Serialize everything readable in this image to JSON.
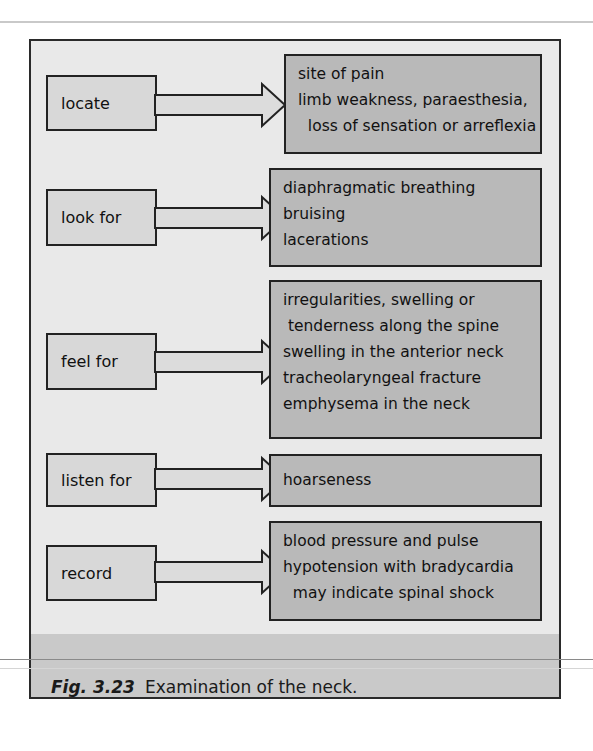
{
  "figure": {
    "caption_label": "Fig. 3.23",
    "caption_text": "Examination of the neck."
  },
  "rows": [
    {
      "action": "locate",
      "items": [
        "site of pain",
        "limb weakness, paraesthesia,",
        "  loss of sensation or arreflexia"
      ]
    },
    {
      "action": "look for",
      "items": [
        "diaphragmatic breathing",
        "bruising",
        "lacerations"
      ]
    },
    {
      "action": "feel for",
      "items": [
        "irregularities, swelling or",
        " tenderness along the spine",
        "swelling in the anterior neck",
        "tracheolaryngeal fracture",
        "emphysema in the neck"
      ]
    },
    {
      "action": "listen for",
      "items": [
        "hoarseness"
      ]
    },
    {
      "action": "record",
      "items": [
        "blood pressure and pulse",
        "hypotension with bradycardia",
        "  may indicate spinal shock"
      ]
    }
  ],
  "colors": {
    "frame_bg": "#e9e9e9",
    "action_box_bg": "#d8d8d8",
    "detail_box_bg": "#b9b9b9",
    "caption_band_bg": "#c9c9c9",
    "border": "#222222"
  }
}
